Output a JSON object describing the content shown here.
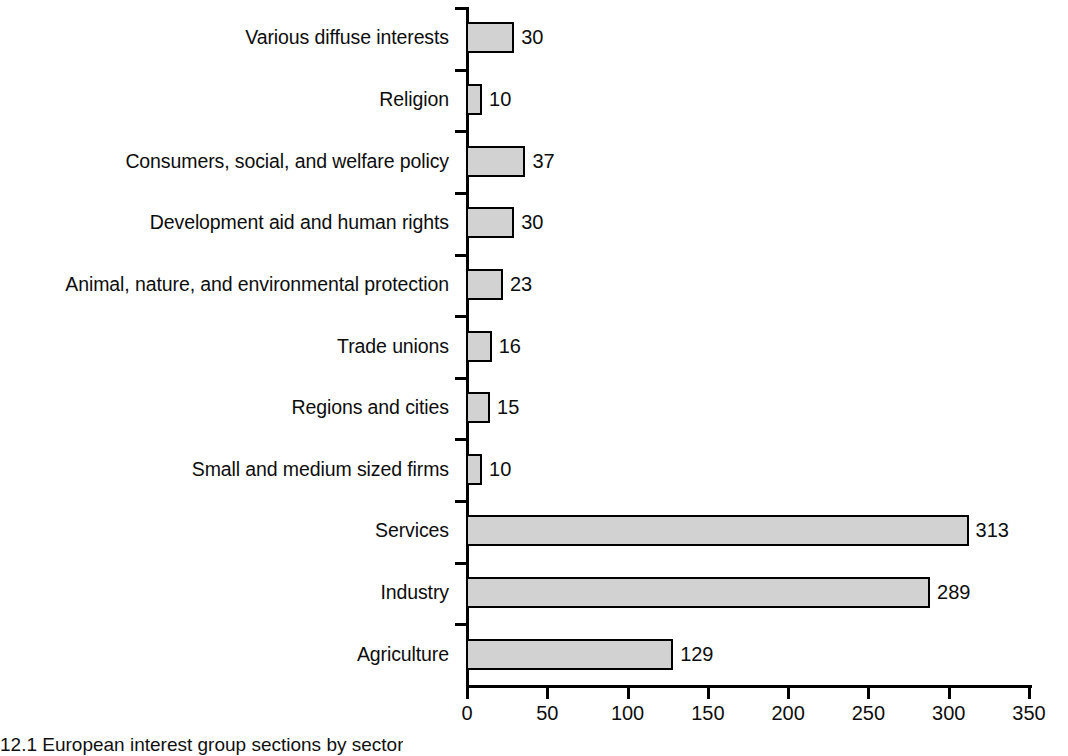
{
  "chart_data": {
    "type": "bar",
    "orientation": "horizontal",
    "title": "",
    "xlabel": "",
    "ylabel": "",
    "xlim": [
      0,
      350
    ],
    "grid": false,
    "legend": null,
    "xticks": [
      "0",
      "50",
      "100",
      "150",
      "200",
      "250",
      "300",
      "350"
    ],
    "xtick_values": [
      0,
      50,
      100,
      150,
      200,
      250,
      300,
      350
    ],
    "categories": [
      "Various diffuse interests",
      "Religion",
      "Consumers, social, and welfare policy",
      "Development aid and human rights",
      "Animal, nature, and environmental protection",
      "Trade unions",
      "Regions and cities",
      "Small and medium sized firms",
      "Services",
      "Industry",
      "Agriculture"
    ],
    "values": [
      30,
      10,
      37,
      30,
      23,
      16,
      15,
      10,
      313,
      289,
      129
    ],
    "value_labels": [
      "30",
      "10",
      "37",
      "30",
      "23",
      "16",
      "15",
      "10",
      "313",
      "289",
      "129"
    ],
    "bar_fill_color": "#d2d2d2",
    "bar_border_color": "#000000",
    "axis_color": "#000000"
  },
  "caption": {
    "text": "12.1 European interest group sections by sector"
  }
}
